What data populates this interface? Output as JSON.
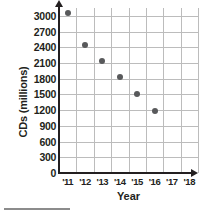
{
  "chart_data": {
    "type": "scatter",
    "title": "",
    "xlabel": "Year",
    "ylabel": "CDs (millions)",
    "x_tick_labels": [
      "'11",
      "'12",
      "'13",
      "'14",
      "'15",
      "'16",
      "'17",
      "'18"
    ],
    "y_tick_labels": [
      "3000",
      "2700",
      "2400",
      "2100",
      "1800",
      "1500",
      "1200",
      "900",
      "600",
      "300",
      "0"
    ],
    "y_ticks": [
      3000,
      2700,
      2400,
      2100,
      1800,
      1500,
      1200,
      900,
      600,
      300,
      0
    ],
    "ylim": [
      0,
      3150
    ],
    "xlim": [
      10.5,
      18.5
    ],
    "grid": true,
    "legend": false,
    "point_color": "#58595b",
    "gridline_color": "#bcbcbc",
    "axis_color": "#231f20",
    "categories": [
      "'11",
      "'12",
      "'13",
      "'14",
      "'15",
      "'16"
    ],
    "values": [
      3050,
      2450,
      2130,
      1830,
      1500,
      1190
    ],
    "points": [
      {
        "x": "'11",
        "y": 3050
      },
      {
        "x": "'12",
        "y": 2450
      },
      {
        "x": "'13",
        "y": 2130
      },
      {
        "x": "'14",
        "y": 1830
      },
      {
        "x": "'15",
        "y": 1500
      },
      {
        "x": "'16",
        "y": 1190
      }
    ]
  }
}
